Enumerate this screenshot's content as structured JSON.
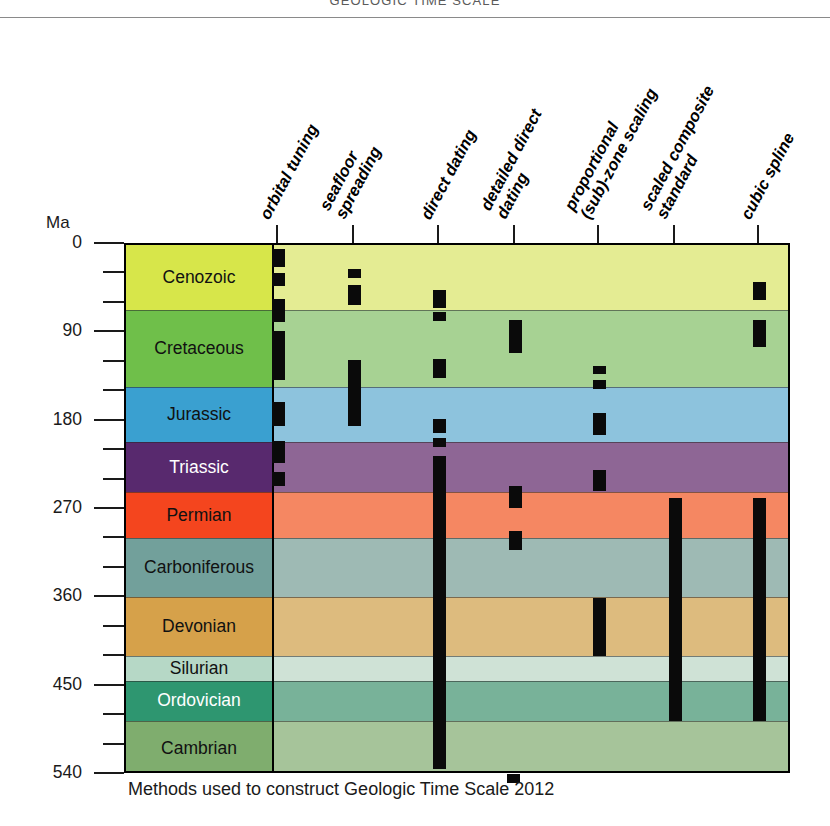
{
  "masthead": {
    "title": "GEOLOGIC TIME SCALE"
  },
  "axis": {
    "unit_label": "Ma",
    "major_ticks": [
      0,
      90,
      180,
      270,
      360,
      450,
      540
    ],
    "minor_tick_interval": 30,
    "range": [
      0,
      540
    ]
  },
  "caption": "Methods used to construct Geologic Time Scale 2012",
  "columns": [
    {
      "id": "orbital-tuning",
      "label": "orbital tuning"
    },
    {
      "id": "seafloor-spreading",
      "label": "seafloor\nspreading"
    },
    {
      "id": "direct-dating",
      "label": "direct dating"
    },
    {
      "id": "detailed-direct-dating",
      "label": "detailed direct\ndating"
    },
    {
      "id": "proportional-zone-scaling",
      "label": "proportional\n(sub)-zone scaling"
    },
    {
      "id": "scaled-composite-standard",
      "label": "scaled composite\nstandard"
    },
    {
      "id": "cubic-spline",
      "label": "cubic spline"
    }
  ],
  "periods": [
    {
      "name": "Cenozoic",
      "start": 0,
      "end": 66,
      "color": "#d7e64a",
      "light": "#e4ec93",
      "text": "dark"
    },
    {
      "name": "Cretaceous",
      "start": 66,
      "end": 145,
      "color": "#6fbf4a",
      "light": "#a7d293",
      "text": "dark"
    },
    {
      "name": "Jurassic",
      "start": 145,
      "end": 201,
      "color": "#3aa0d0",
      "light": "#8dc3dd",
      "text": "dark"
    },
    {
      "name": "Triassic",
      "start": 201,
      "end": 252,
      "color": "#58296e",
      "light": "#8e6695",
      "text": "light"
    },
    {
      "name": "Permian",
      "start": 252,
      "end": 299,
      "color": "#f4451e",
      "light": "#f58762",
      "text": "dark"
    },
    {
      "name": "Carboniferous",
      "start": 299,
      "end": 359,
      "color": "#72a09b",
      "light": "#9ebab4",
      "text": "dark"
    },
    {
      "name": "Devonian",
      "start": 359,
      "end": 419,
      "color": "#d6a14a",
      "light": "#ddbb7e",
      "text": "dark"
    },
    {
      "name": "Silurian",
      "start": 419,
      "end": 444,
      "color": "#b6d8c6",
      "light": "#cfe2d6",
      "text": "dark"
    },
    {
      "name": "Ordovician",
      "start": 444,
      "end": 485,
      "color": "#2e9670",
      "light": "#78b299",
      "text": "light"
    },
    {
      "name": "Cambrian",
      "start": 485,
      "end": 540,
      "color": "#7fad6e",
      "light": "#a6c49a",
      "text": "dark"
    }
  ],
  "chart_data": {
    "type": "bar",
    "title": "Methods used to construct Geologic Time Scale 2012",
    "xlabel": "",
    "ylabel": "Ma",
    "ylim": [
      0,
      540
    ],
    "y_inverted": true,
    "grid": false,
    "categories": [
      "orbital tuning",
      "seafloor spreading",
      "direct dating",
      "detailed direct dating",
      "proportional (sub)-zone scaling",
      "scaled composite standard",
      "cubic spline"
    ],
    "series": [
      {
        "name": "orbital tuning",
        "intervals": [
          [
            4,
            22
          ],
          [
            29,
            42
          ],
          [
            55,
            78
          ],
          [
            88,
            138
          ],
          [
            160,
            184
          ],
          [
            200,
            222
          ],
          [
            231,
            246
          ]
        ]
      },
      {
        "name": "seafloor spreading",
        "intervals": [
          [
            24,
            34
          ],
          [
            41,
            61
          ],
          [
            117,
            184
          ]
        ]
      },
      {
        "name": "direct dating",
        "intervals": [
          [
            46,
            64
          ],
          [
            68,
            77
          ],
          [
            116,
            136
          ],
          [
            177,
            192
          ],
          [
            197,
            206
          ],
          [
            215,
            534
          ]
        ]
      },
      {
        "name": "detailed direct dating",
        "intervals": [
          [
            76,
            110
          ],
          [
            246,
            268
          ],
          [
            291,
            311
          ],
          [
            539,
            548
          ]
        ]
      },
      {
        "name": "proportional (sub)-zone scaling",
        "intervals": [
          [
            123,
            131
          ],
          [
            138,
            147
          ],
          [
            171,
            194
          ],
          [
            229,
            251
          ],
          [
            360,
            419
          ]
        ]
      },
      {
        "name": "scaled composite standard",
        "intervals": [
          [
            258,
            485
          ]
        ]
      },
      {
        "name": "cubic spline",
        "intervals": [
          [
            38,
            56
          ],
          [
            76,
            104
          ],
          [
            258,
            485
          ]
        ]
      }
    ]
  }
}
